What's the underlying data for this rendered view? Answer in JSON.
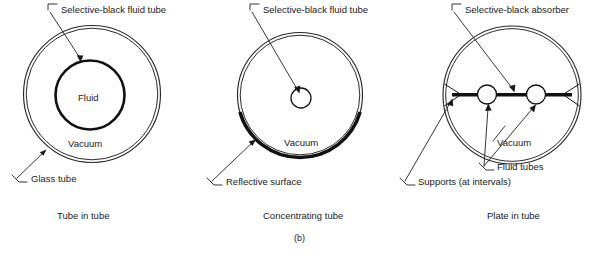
{
  "figure": {
    "caption": "(b)",
    "panels": [
      {
        "id": "tube-in-tube",
        "title": "Tube in tube",
        "labels": {
          "top": "Selective-black fluid tube",
          "inner_region": "Fluid",
          "gap_region": "Vacuum",
          "outer": "Glass tube"
        }
      },
      {
        "id": "concentrating-tube",
        "title": "Concentrating tube",
        "labels": {
          "top": "Selective-black fluid tube",
          "gap_region": "Vacuum",
          "bottom": "Reflective surface"
        }
      },
      {
        "id": "plate-in-tube",
        "title": "Plate in tube",
        "labels": {
          "top": "Selective-black absorber",
          "gap_region": "Vacuum",
          "tubes": "Fluid tubes",
          "supports": "Supports (at intervals)"
        }
      }
    ]
  },
  "colors": {
    "ink": "#1a1a1a",
    "line": "#2b2b2b",
    "absorber": "#111111",
    "background": "#ffffff"
  }
}
